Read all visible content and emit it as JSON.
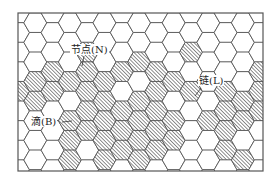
{
  "figure": {
    "type": "hexagonal-grid-network-diagram",
    "frame": {
      "x": 18,
      "y": 13,
      "width": 245,
      "height": 158
    },
    "hex": {
      "orientation": "flat-top",
      "radius": 11.5,
      "col_spacing": 17.3,
      "row_spacing": 19.6,
      "odd_col_offset": 9.8,
      "origin_x": 18,
      "origin_y": 13,
      "cols": 16,
      "rows": 9
    },
    "colors": {
      "line": "#555555",
      "frame": "#555555",
      "hatch": "#555555",
      "fill": "#ffffff",
      "background": "#ffffff"
    },
    "hatched_cells": [
      [
        4,
        2
      ],
      [
        4,
        3
      ],
      [
        4,
        4
      ],
      [
        4,
        5
      ],
      [
        4,
        6
      ],
      [
        3,
        3
      ],
      [
        3,
        5
      ],
      [
        3,
        6
      ],
      [
        3,
        7
      ],
      [
        2,
        4
      ],
      [
        2,
        3
      ],
      [
        1,
        4
      ],
      [
        1,
        3
      ],
      [
        0,
        4
      ],
      [
        5,
        3
      ],
      [
        5,
        4
      ],
      [
        5,
        5
      ],
      [
        5,
        6
      ],
      [
        5,
        7
      ],
      [
        6,
        3
      ],
      [
        6,
        5
      ],
      [
        6,
        6
      ],
      [
        6,
        7
      ],
      [
        7,
        2
      ],
      [
        7,
        4
      ],
      [
        8,
        3
      ],
      [
        8,
        4
      ],
      [
        8,
        5
      ],
      [
        8,
        6
      ],
      [
        8,
        7
      ],
      [
        9,
        3
      ],
      [
        9,
        5
      ],
      [
        9,
        6
      ],
      [
        10,
        2
      ],
      [
        10,
        4
      ],
      [
        11,
        5
      ],
      [
        12,
        4
      ],
      [
        12,
        5
      ],
      [
        12,
        6
      ],
      [
        12,
        7
      ],
      [
        13,
        4
      ],
      [
        13,
        5
      ],
      [
        13,
        7
      ],
      [
        14,
        3
      ],
      [
        14,
        4
      ],
      [
        14,
        5
      ],
      [
        15,
        3
      ],
      [
        15,
        4
      ],
      [
        7,
        5
      ],
      [
        7,
        6
      ],
      [
        7,
        7
      ]
    ]
  },
  "labels": {
    "node": {
      "text": "节点(N)",
      "x": 70,
      "y": 44,
      "leader": [
        [
          84,
          56
        ],
        [
          82,
          66
        ]
      ]
    },
    "link": {
      "text": "链(L)",
      "x": 198,
      "y": 75,
      "leader": [
        [
          201,
          88
        ],
        [
          195,
          96
        ]
      ]
    },
    "drop": {
      "text": "滴(B)",
      "x": 30,
      "y": 116,
      "leader": [
        [
          62,
          122
        ],
        [
          72,
          121
        ]
      ]
    }
  }
}
